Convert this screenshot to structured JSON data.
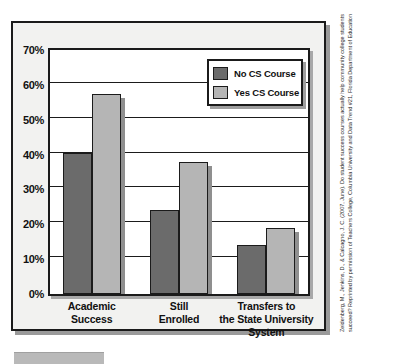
{
  "chart_data": {
    "type": "bar",
    "title": "",
    "subtitle": "",
    "xlabel": "",
    "ylabel": "",
    "ylim": [
      0,
      70
    ],
    "ytick_labels": [
      "0%",
      "10%",
      "20%",
      "30%",
      "40%",
      "50%",
      "60%",
      "70%"
    ],
    "ytick_values": [
      0,
      10,
      20,
      30,
      40,
      50,
      60,
      70
    ],
    "grid": true,
    "legend_position": "upper-right-inside",
    "categories": [
      "Academic Success",
      "Still Enrolled",
      "Transfers to the State University System"
    ],
    "category_label_lines": [
      [
        "Academic",
        "Success"
      ],
      [
        "Still",
        "Enrolled"
      ],
      [
        "Transfers to",
        "the State University",
        "System"
      ]
    ],
    "series": [
      {
        "name": "No CS Course",
        "color": "#6b6b6b",
        "values": [
          40.5,
          24.0,
          14.0
        ]
      },
      {
        "name": "Yes CS Course",
        "color": "#b5b5b5",
        "values": [
          57.5,
          38.0,
          19.0
        ]
      }
    ]
  },
  "legend": {
    "items": [
      {
        "label": "No CS Course",
        "color": "#6b6b6b"
      },
      {
        "label": "Yes CS Course",
        "color": "#b5b5b5"
      }
    ]
  },
  "citation": {
    "text": "Zeidenberg, M., Jenkins, D., & Calcagno, J. C. (2007, June). Do student success courses actually help community college students succeed? Reprinted by permission of Teachers College, Columbia University and Data Trend #21, Florida Department of Education"
  },
  "colors": {
    "series_dark": "#6b6b6b",
    "series_light": "#b5b5b5",
    "frame": "#1b1b1b",
    "page_background": "#f2f2f0",
    "plot_background": "#ffffff"
  }
}
